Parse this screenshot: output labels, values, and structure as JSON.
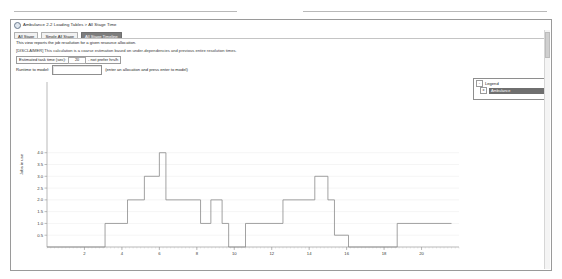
{
  "window": {
    "title": "Ambulance 2-2 Loading Tables > All Stage Time",
    "icon": "app-window-icon"
  },
  "tabs": [
    {
      "label": "All Stage",
      "active": false
    },
    {
      "label": "Single All Stage",
      "active": false
    },
    {
      "label": "All Stage Timeline",
      "active": true
    }
  ],
  "info": {
    "line1": "This view reports the job resolution for a given resource allocation.",
    "line2": "[DISCLAIMER] This calculation is a coarse estimation based on under-dependencies and previous entire resolution times."
  },
  "estimate": {
    "label_before": "Estimated task time (sec):",
    "value": "20",
    "label_after": "- not prefer hrs/h"
  },
  "runtime": {
    "label": "Runtime to model:",
    "value": "",
    "placeholder": "",
    "hint": "(enter an allocation and press enter to model)"
  },
  "legend": {
    "title": "Legend",
    "expand_glyph": "-",
    "check_glyph": "x",
    "items": [
      {
        "label": "Ambulance",
        "selected": true
      }
    ]
  },
  "chart_data": {
    "type": "line",
    "line_style": "step",
    "title": "",
    "xlabel": "",
    "ylabel": "Jobs in use",
    "xlim": [
      0,
      22
    ],
    "ylim": [
      0,
      7.0
    ],
    "grid": true,
    "legend_position": "right",
    "yticks": [
      0.5,
      1.0,
      1.5,
      2.0,
      2.5,
      3.0,
      3.5,
      4.0
    ],
    "ytick_labels": [
      "0.5",
      "1.0",
      "1.5",
      "2.0",
      "2.5",
      "3.0",
      "3.5",
      "4.0"
    ],
    "xticks": [
      2,
      4,
      6,
      8,
      10,
      12,
      14,
      16,
      18,
      20
    ],
    "xtick_labels": [
      "2",
      "4",
      "6",
      "8",
      "10",
      "12",
      "14",
      "16",
      "18",
      "20"
    ],
    "series": [
      {
        "name": "Ambulance",
        "color": "#8a8a8a",
        "x": [
          0.0,
          3.1,
          3.1,
          4.3,
          4.3,
          5.2,
          5.2,
          6.0,
          6.0,
          6.35,
          6.35,
          8.2,
          8.2,
          8.75,
          8.75,
          9.35,
          9.35,
          9.7,
          9.7,
          10.6,
          10.6,
          12.6,
          12.6,
          14.3,
          14.3,
          15.0,
          15.0,
          15.35,
          15.35,
          16.1,
          16.1,
          18.7,
          18.7,
          21.6
        ],
        "y": [
          0.0,
          0.0,
          1.0,
          1.0,
          2.0,
          2.0,
          3.0,
          3.0,
          4.0,
          4.0,
          2.0,
          2.0,
          1.0,
          1.0,
          2.0,
          2.0,
          1.0,
          1.0,
          0.0,
          0.0,
          1.0,
          1.0,
          2.0,
          2.0,
          3.0,
          3.0,
          2.0,
          2.0,
          0.5,
          0.5,
          0.0,
          0.0,
          1.0,
          1.0
        ]
      }
    ]
  }
}
